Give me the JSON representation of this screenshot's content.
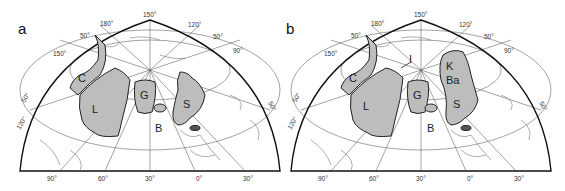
{
  "figure": {
    "type": "polar-projection-map-pair",
    "colors": {
      "craton_fill": "#bdbdbd",
      "outline": "#222222",
      "graticule": "#555555",
      "coast": "#666666",
      "background": "#ffffff"
    }
  },
  "panels": [
    {
      "label": "a",
      "top_ticks": [
        "150°",
        "180°",
        "120°",
        "50°",
        "50°",
        "150°",
        "90°"
      ],
      "rim_ticks": {
        "left_upper": "50°",
        "left_lower": "120°",
        "right": "50°"
      },
      "bottom_ticks": [
        "90°",
        "60°",
        "30°",
        "0°",
        "30°"
      ],
      "regions": [
        {
          "id": "C",
          "label": "C"
        },
        {
          "id": "L",
          "label": "L"
        },
        {
          "id": "G",
          "label": "G"
        },
        {
          "id": "S",
          "label": "S"
        },
        {
          "id": "B",
          "label": "B"
        }
      ]
    },
    {
      "label": "b",
      "top_ticks": [
        "150°",
        "180°",
        "120°",
        "50°",
        "50°",
        "150°",
        "90°"
      ],
      "rim_ticks": {
        "left_upper": "50°",
        "left_lower": "120°",
        "right": "50°"
      },
      "bottom_ticks": [
        "90°",
        "60°",
        "30°",
        "0°",
        "30°"
      ],
      "regions": [
        {
          "id": "C",
          "label": "C"
        },
        {
          "id": "L",
          "label": "L"
        },
        {
          "id": "G",
          "label": "G"
        },
        {
          "id": "I",
          "label": "I"
        },
        {
          "id": "K",
          "label": "K"
        },
        {
          "id": "Ba",
          "label": "Ba"
        },
        {
          "id": "S",
          "label": "S"
        },
        {
          "id": "B",
          "label": "B"
        }
      ]
    }
  ]
}
